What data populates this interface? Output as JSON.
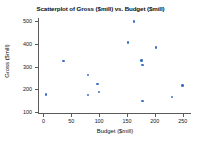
{
  "chart_data": {
    "type": "scatter",
    "title": "Scatterplot of Gross ($mill) vs. Budget ($mill)",
    "xlabel": "Budget ($mill)",
    "ylabel": "Gross ($mill)",
    "xlim": [
      -8,
      265
    ],
    "ylim": [
      95,
      515
    ],
    "xticks": [
      0,
      50,
      100,
      150,
      200,
      250
    ],
    "yticks": [
      100,
      200,
      300,
      400,
      500
    ],
    "xtick_labels": [
      "0",
      "50",
      "100",
      "150",
      "200",
      "250"
    ],
    "ytick_labels": [
      "100",
      "200",
      "300",
      "400",
      "500"
    ],
    "grid": false,
    "legend": false,
    "marker_color": "#3b6fc4",
    "points": [
      {
        "x": 5,
        "y": 177
      },
      {
        "x": 36,
        "y": 324
      },
      {
        "x": 80,
        "y": 263
      },
      {
        "x": 80,
        "y": 174
      },
      {
        "x": 97,
        "y": 224
      },
      {
        "x": 100,
        "y": 188
      },
      {
        "x": 152,
        "y": 406
      },
      {
        "x": 163,
        "y": 500
      },
      {
        "x": 176,
        "y": 328
      },
      {
        "x": 178,
        "y": 306
      },
      {
        "x": 178,
        "y": 148
      },
      {
        "x": 202,
        "y": 384
      },
      {
        "x": 231,
        "y": 165
      },
      {
        "x": 250,
        "y": 217
      }
    ]
  }
}
